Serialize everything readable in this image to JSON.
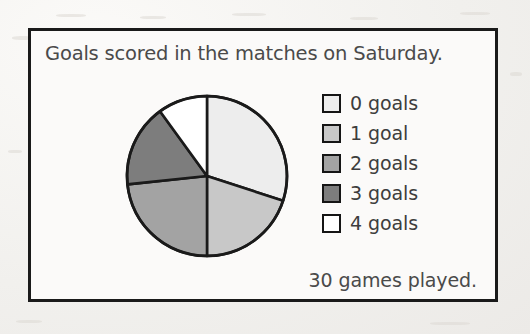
{
  "card": {
    "title": "Goals scored in the matches on Saturday.",
    "footer": "30 games played."
  },
  "legend": {
    "items": [
      {
        "label": "0 goals",
        "color": "#ededed"
      },
      {
        "label": "1 goal",
        "color": "#c8c8c8"
      },
      {
        "label": "2 goals",
        "color": "#a3a3a3"
      },
      {
        "label": "3 goals",
        "color": "#7d7d7d"
      },
      {
        "label": "4 goals",
        "color": "#ffffff"
      }
    ]
  },
  "chart_data": {
    "type": "pie",
    "title": "Goals scored in the matches on Saturday.",
    "annotation": "30 games played.",
    "total": 30,
    "unit": "games",
    "legend_position": "right",
    "start_angle_deg": 0,
    "direction": "clockwise",
    "categories": [
      "0 goals",
      "1 goal",
      "2 goals",
      "3 goals",
      "4 goals"
    ],
    "values": [
      9,
      6,
      7,
      5,
      3
    ],
    "percentages": [
      30,
      20,
      23.3,
      16.7,
      10
    ],
    "angles_deg": [
      108,
      72,
      84,
      60,
      36
    ],
    "colors": [
      "#ededed",
      "#c8c8c8",
      "#a3a3a3",
      "#7d7d7d",
      "#ffffff"
    ],
    "slice_edge_color": "#1a1a1a",
    "grid": false
  }
}
